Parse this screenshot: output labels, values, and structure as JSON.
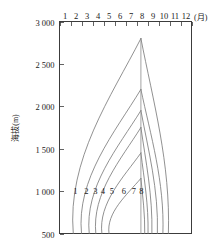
{
  "chart_data": {
    "type": "line",
    "title": "",
    "subtitle": "",
    "xlabel": "(月)",
    "ylabel": "海拔(m)",
    "x_axis_position": "top",
    "grid": false,
    "legend": "none",
    "xlim": [
      0,
      12
    ],
    "ylim": [
      500,
      3000
    ],
    "x_tick_labels": [
      "1",
      "2",
      "3",
      "4",
      "5",
      "6",
      "7",
      "8",
      "9",
      "10",
      "11",
      "12"
    ],
    "x_tick_values": [
      0,
      1,
      2,
      3,
      4,
      5,
      6,
      7,
      8,
      9,
      10,
      11,
      12
    ],
    "y_tick_labels": [
      "3 000",
      "2 500",
      "2 000",
      "1 500",
      "1 000",
      "500"
    ],
    "y_tick_values": [
      3000,
      2500,
      2000,
      1500,
      1000,
      500
    ],
    "band_labels": [
      "1",
      "2",
      "3",
      "4",
      "5",
      "6",
      "7",
      "8"
    ],
    "band_label_altitude": 1000,
    "band_label_months": [
      1.45,
      2.45,
      3.25,
      3.95,
      4.75,
      5.85,
      6.75,
      7.45
    ],
    "series": [
      {
        "name": "contour-1",
        "apex": {
          "month": 7.4,
          "altitude": 2800
        },
        "left_base": {
          "month": 1.25,
          "altitude": 500
        },
        "right_base": {
          "month": 9.9,
          "altitude": 500
        }
      },
      {
        "name": "contour-2",
        "apex": {
          "month": 7.4,
          "altitude": 2200
        },
        "left_base": {
          "month": 2.0,
          "altitude": 500
        },
        "right_base": {
          "month": 9.4,
          "altitude": 500
        }
      },
      {
        "name": "contour-3",
        "apex": {
          "month": 7.4,
          "altitude": 1950
        },
        "left_base": {
          "month": 2.7,
          "altitude": 500
        },
        "right_base": {
          "month": 8.9,
          "altitude": 500
        }
      },
      {
        "name": "contour-4",
        "apex": {
          "month": 7.4,
          "altitude": 1750
        },
        "left_base": {
          "month": 3.3,
          "altitude": 500
        },
        "right_base": {
          "month": 8.4,
          "altitude": 500
        }
      },
      {
        "name": "contour-5",
        "apex": {
          "month": 7.4,
          "altitude": 1450
        },
        "left_base": {
          "month": 3.85,
          "altitude": 500
        },
        "right_base": {
          "month": 8.05,
          "altitude": 500
        }
      },
      {
        "name": "contour-6",
        "apex": {
          "month": 7.4,
          "altitude": 1150
        },
        "left_base": {
          "month": 4.5,
          "altitude": 500
        },
        "right_base": {
          "month": 7.75,
          "altitude": 500
        }
      }
    ],
    "center_line": {
      "month": 7.4,
      "from_altitude": 500,
      "to_altitude": 2800
    }
  },
  "axes": {
    "y_unit": "m",
    "y_name": "海拔",
    "x_unit_label": "(月)"
  },
  "colors": {
    "frame": "#3c3c3c",
    "contour": "#757575",
    "text": "#1a1a1a",
    "background": "#ffffff"
  }
}
